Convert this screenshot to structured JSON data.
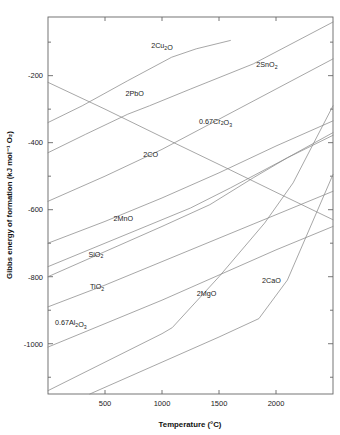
{
  "chart_data": {
    "type": "line",
    "title": "",
    "xlabel": "Temperature (°C)",
    "ylabel": "Gibbs energy of formation (kJ mol⁻¹ O₂)",
    "xlim": [
      0,
      2500
    ],
    "ylim": [
      -1150,
      -25
    ],
    "grid": false,
    "legend_position": "inline-labels",
    "xticks": [
      500,
      1000,
      1500,
      2000
    ],
    "xtick_labels": [
      "500",
      "1000",
      "1500",
      "2000"
    ],
    "yticks": [
      -200,
      -400,
      -600,
      -800,
      -1000
    ],
    "ytick_labels": [
      "-200",
      "-400",
      "-600",
      "-800",
      "-1000"
    ],
    "yminorticks": [
      -100,
      -300,
      -500,
      -700,
      -900,
      -1100
    ],
    "series": [
      {
        "name": "2Cu2O",
        "label_parts": [
          {
            "t": "2Cu",
            "k": "n"
          },
          {
            "t": "2",
            "k": "sub"
          },
          {
            "t": "O",
            "k": "n"
          }
        ],
        "label_x": 1000,
        "label_y": -118,
        "x": [
          0,
          300,
          700,
          1085,
          1300,
          1600
        ],
        "y": [
          -340,
          -290,
          -215,
          -145,
          -120,
          -95
        ]
      },
      {
        "name": "2SnO2",
        "label_parts": [
          {
            "t": "2SnO",
            "k": "n"
          },
          {
            "t": "2",
            "k": "sub"
          }
        ],
        "label_x": 1920,
        "label_y": -175,
        "x": [
          0,
          500,
          1000,
          1500,
          2000,
          2500
        ],
        "y": [
          -575,
          -500,
          -420,
          -330,
          -240,
          -150
        ]
      },
      {
        "name": "2PbO",
        "label_parts": [
          {
            "t": "2PbO",
            "k": "n"
          }
        ],
        "label_x": 760,
        "label_y": -262,
        "x": [
          0,
          330,
          700,
          890,
          1250,
          1800,
          2500
        ],
        "y": [
          -430,
          -375,
          -315,
          -290,
          -240,
          -165,
          -40
        ]
      },
      {
        "name": "0.67Cr2O3",
        "label_parts": [
          {
            "t": "0.67Cr",
            "k": "n"
          },
          {
            "t": "2",
            "k": "sub"
          },
          {
            "t": "O",
            "k": "n"
          },
          {
            "t": "3",
            "k": "sub"
          }
        ],
        "label_x": 1470,
        "label_y": -343,
        "x": [
          0,
          500,
          1000,
          1500,
          2000,
          2500
        ],
        "y": [
          -700,
          -635,
          -565,
          -490,
          -410,
          -335
        ]
      },
      {
        "name": "2CO",
        "label_parts": [
          {
            "t": "2CO",
            "k": "n"
          }
        ],
        "label_x": 900,
        "label_y": -443,
        "x": [
          0,
          500,
          1000,
          1500,
          2000,
          2500
        ],
        "y": [
          -220,
          -300,
          -383,
          -465,
          -548,
          -630
        ]
      },
      {
        "name": "2MnO",
        "label_parts": [
          {
            "t": "2MnO",
            "k": "n"
          }
        ],
        "label_x": 660,
        "label_y": -635,
        "x": [
          0,
          500,
          1000,
          1250,
          1600,
          2100,
          2500
        ],
        "y": [
          -770,
          -700,
          -630,
          -595,
          -535,
          -445,
          -378
        ]
      },
      {
        "name": "SiO2",
        "label_parts": [
          {
            "t": "SiO",
            "k": "n"
          },
          {
            "t": "2",
            "k": "sub"
          }
        ],
        "label_x": 420,
        "label_y": -740,
        "x": [
          0,
          500,
          1000,
          1420,
          1800,
          2100,
          2500
        ],
        "y": [
          -800,
          -725,
          -650,
          -585,
          -505,
          -445,
          -370
        ]
      },
      {
        "name": "TiO2",
        "label_parts": [
          {
            "t": "TiO",
            "k": "n"
          },
          {
            "t": "2",
            "k": "sub"
          }
        ],
        "label_x": 430,
        "label_y": -838,
        "x": [
          0,
          500,
          1000,
          1500,
          2000,
          2500
        ],
        "y": [
          -890,
          -825,
          -755,
          -685,
          -615,
          -545
        ]
      },
      {
        "name": "0.67Al2O3",
        "label_parts": [
          {
            "t": "0.67Al",
            "k": "n"
          },
          {
            "t": "2",
            "k": "sub"
          },
          {
            "t": "O",
            "k": "n"
          },
          {
            "t": "3",
            "k": "sub"
          }
        ],
        "label_x": 200,
        "label_y": -945,
        "x": [
          0,
          500,
          1000,
          1500,
          2000,
          2500
        ],
        "y": [
          -1010,
          -940,
          -870,
          -795,
          -720,
          -650
        ]
      },
      {
        "name": "2MgO",
        "label_parts": [
          {
            "t": "2MgO",
            "k": "n"
          }
        ],
        "label_x": 1390,
        "label_y": -858,
        "x": [
          0,
          500,
          1000,
          1090,
          1500,
          1900,
          2150,
          2500
        ],
        "y": [
          -1140,
          -1055,
          -970,
          -952,
          -800,
          -640,
          -520,
          -290
        ]
      },
      {
        "name": "2CaO",
        "label_parts": [
          {
            "t": "2CaO",
            "k": "n"
          }
        ],
        "label_x": 1960,
        "label_y": -820,
        "x": [
          0,
          500,
          1000,
          1500,
          1850,
          2100,
          2500
        ],
        "y": [
          -1205,
          -1130,
          -1055,
          -980,
          -925,
          -810,
          -495
        ]
      }
    ]
  }
}
